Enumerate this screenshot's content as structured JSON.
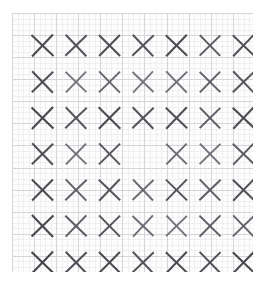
{
  "figure": {
    "background_color": "#ffffff",
    "paper_color": "#fdfdfd"
  },
  "grid_paper": {
    "name": "graph-paper",
    "left": 12,
    "top": 13,
    "width": 241,
    "height": 259,
    "minor_spacing": 5.52,
    "major_every": 4,
    "minor_color": "#e8e8ea",
    "major_color": "#d2d2d6",
    "minor_width": 0.6,
    "major_width": 0.9
  },
  "chart_data": {
    "type": "scatter",
    "xlabel": "",
    "ylabel": "",
    "rows": 7,
    "cols": 7,
    "marker": "x",
    "xlim": [
      0,
      7
    ],
    "ylim": [
      0,
      7
    ],
    "grid": true,
    "legend": false,
    "missing_cells": [
      [
        4,
        4
      ]
    ],
    "cell_width": 33.1,
    "cell_height": 35.4,
    "origin_x": 14,
    "origin_y": 15,
    "marker_size": 21,
    "stroke_width": 2.0,
    "markers": [
      {
        "row": 1,
        "col": 1,
        "cx": 30.5,
        "cy": 32.5,
        "size": 21.5,
        "color": "#4a4a4f",
        "width": 2.05,
        "rot": -1.5
      },
      {
        "row": 1,
        "col": 2,
        "cx": 64.0,
        "cy": 32.5,
        "size": 21.0,
        "color": "#53535a",
        "width": 2.0,
        "rot": 1.0
      },
      {
        "row": 1,
        "col": 3,
        "cx": 97.5,
        "cy": 32.5,
        "size": 21.0,
        "color": "#4d4d53",
        "width": 2.05,
        "rot": -0.5
      },
      {
        "row": 1,
        "col": 4,
        "cx": 131.0,
        "cy": 32.5,
        "size": 21.0,
        "color": "#54545b",
        "width": 2.0,
        "rot": 1.5
      },
      {
        "row": 1,
        "col": 5,
        "cx": 164.5,
        "cy": 32.5,
        "size": 21.0,
        "color": "#4b4b51",
        "width": 2.05,
        "rot": -1.0
      },
      {
        "row": 1,
        "col": 6,
        "cx": 198.0,
        "cy": 32.5,
        "size": 20.5,
        "color": "#5a5a61",
        "width": 1.95,
        "rot": 0.5
      },
      {
        "row": 1,
        "col": 7,
        "cx": 231.5,
        "cy": 32.5,
        "size": 21.0,
        "color": "#505057",
        "width": 2.0,
        "rot": -1.0
      },
      {
        "row": 2,
        "col": 1,
        "cx": 30.5,
        "cy": 69.0,
        "size": 21.0,
        "color": "#4e4e55",
        "width": 2.0,
        "rot": 1.0
      },
      {
        "row": 2,
        "col": 2,
        "cx": 64.0,
        "cy": 69.0,
        "size": 20.5,
        "color": "#73737b",
        "width": 1.85,
        "rot": -1.0
      },
      {
        "row": 2,
        "col": 3,
        "cx": 97.5,
        "cy": 69.0,
        "size": 21.0,
        "color": "#65656d",
        "width": 1.9,
        "rot": 0.5
      },
      {
        "row": 2,
        "col": 4,
        "cx": 131.0,
        "cy": 69.0,
        "size": 20.5,
        "color": "#75757d",
        "width": 1.85,
        "rot": -1.5
      },
      {
        "row": 2,
        "col": 5,
        "cx": 164.5,
        "cy": 69.0,
        "size": 21.0,
        "color": "#6d6d75",
        "width": 1.9,
        "rot": 1.0
      },
      {
        "row": 2,
        "col": 6,
        "cx": 198.0,
        "cy": 69.0,
        "size": 20.5,
        "color": "#5e5e66",
        "width": 1.95,
        "rot": -0.5
      },
      {
        "row": 2,
        "col": 7,
        "cx": 231.5,
        "cy": 69.0,
        "size": 21.0,
        "color": "#55555c",
        "width": 2.0,
        "rot": 1.0
      },
      {
        "row": 3,
        "col": 1,
        "cx": 30.5,
        "cy": 105.0,
        "size": 21.5,
        "color": "#48484e",
        "width": 2.1,
        "rot": -1.0
      },
      {
        "row": 3,
        "col": 2,
        "cx": 64.0,
        "cy": 105.0,
        "size": 21.0,
        "color": "#57575e",
        "width": 2.0,
        "rot": 1.5
      },
      {
        "row": 3,
        "col": 3,
        "cx": 97.5,
        "cy": 105.0,
        "size": 21.5,
        "color": "#4a4a50",
        "width": 2.1,
        "rot": -0.5
      },
      {
        "row": 3,
        "col": 4,
        "cx": 131.0,
        "cy": 105.0,
        "size": 21.0,
        "color": "#52525a",
        "width": 2.0,
        "rot": 1.0
      },
      {
        "row": 3,
        "col": 5,
        "cx": 164.5,
        "cy": 105.0,
        "size": 21.0,
        "color": "#4e4e55",
        "width": 2.05,
        "rot": -1.0
      },
      {
        "row": 3,
        "col": 6,
        "cx": 198.0,
        "cy": 105.0,
        "size": 20.5,
        "color": "#5c5c64",
        "width": 1.95,
        "rot": 0.5
      },
      {
        "row": 3,
        "col": 7,
        "cx": 231.5,
        "cy": 105.0,
        "size": 21.0,
        "color": "#4c4c52",
        "width": 2.05,
        "rot": -1.5
      },
      {
        "row": 4,
        "col": 1,
        "cx": 30.5,
        "cy": 141.0,
        "size": 21.0,
        "color": "#4f4f56",
        "width": 2.0,
        "rot": 1.0
      },
      {
        "row": 4,
        "col": 2,
        "cx": 64.0,
        "cy": 141.0,
        "size": 20.5,
        "color": "#70707a",
        "width": 1.85,
        "rot": -1.0
      },
      {
        "row": 4,
        "col": 3,
        "cx": 97.5,
        "cy": 141.0,
        "size": 21.0,
        "color": "#56565e",
        "width": 2.0,
        "rot": 0.5
      },
      {
        "row": 4,
        "col": 5,
        "cx": 164.5,
        "cy": 141.0,
        "size": 20.5,
        "color": "#6a6a73",
        "width": 1.9,
        "rot": -0.5
      },
      {
        "row": 4,
        "col": 6,
        "cx": 198.0,
        "cy": 141.0,
        "size": 20.5,
        "color": "#6e6e77",
        "width": 1.85,
        "rot": 1.0
      },
      {
        "row": 4,
        "col": 7,
        "cx": 231.5,
        "cy": 141.0,
        "size": 21.0,
        "color": "#5a5a62",
        "width": 1.95,
        "rot": -1.0
      },
      {
        "row": 5,
        "col": 1,
        "cx": 30.5,
        "cy": 177.0,
        "size": 21.0,
        "color": "#4b4b52",
        "width": 2.05,
        "rot": -0.5
      },
      {
        "row": 5,
        "col": 2,
        "cx": 64.0,
        "cy": 177.0,
        "size": 21.0,
        "color": "#60606a",
        "width": 1.95,
        "rot": 1.0
      },
      {
        "row": 5,
        "col": 3,
        "cx": 97.5,
        "cy": 177.0,
        "size": 21.0,
        "color": "#55555d",
        "width": 2.0,
        "rot": -1.0
      },
      {
        "row": 5,
        "col": 4,
        "cx": 131.0,
        "cy": 177.0,
        "size": 20.5,
        "color": "#6b6b74",
        "width": 1.9,
        "rot": 1.5
      },
      {
        "row": 5,
        "col": 5,
        "cx": 164.5,
        "cy": 177.0,
        "size": 21.0,
        "color": "#52525a",
        "width": 2.0,
        "rot": -0.5
      },
      {
        "row": 5,
        "col": 6,
        "cx": 198.0,
        "cy": 177.0,
        "size": 21.0,
        "color": "#5d5d66",
        "width": 1.95,
        "rot": 1.0
      },
      {
        "row": 5,
        "col": 7,
        "cx": 231.5,
        "cy": 177.0,
        "size": 21.0,
        "color": "#4e4e56",
        "width": 2.0,
        "rot": -1.0
      },
      {
        "row": 6,
        "col": 1,
        "cx": 30.5,
        "cy": 213.0,
        "size": 21.5,
        "color": "#47474d",
        "width": 2.1,
        "rot": 1.0
      },
      {
        "row": 6,
        "col": 2,
        "cx": 64.0,
        "cy": 213.0,
        "size": 21.0,
        "color": "#5b5b63",
        "width": 1.95,
        "rot": -1.0
      },
      {
        "row": 6,
        "col": 3,
        "cx": 97.5,
        "cy": 213.0,
        "size": 21.0,
        "color": "#54545c",
        "width": 2.0,
        "rot": 0.5
      },
      {
        "row": 6,
        "col": 4,
        "cx": 131.0,
        "cy": 213.0,
        "size": 20.5,
        "color": "#6c6c76",
        "width": 1.85,
        "rot": -1.5
      },
      {
        "row": 6,
        "col": 5,
        "cx": 164.5,
        "cy": 213.0,
        "size": 20.5,
        "color": "#6f6f79",
        "width": 1.85,
        "rot": 1.0
      },
      {
        "row": 6,
        "col": 6,
        "cx": 198.0,
        "cy": 213.0,
        "size": 21.0,
        "color": "#5a5a63",
        "width": 1.95,
        "rot": -0.5
      },
      {
        "row": 6,
        "col": 7,
        "cx": 231.5,
        "cy": 213.0,
        "size": 21.0,
        "color": "#63636c",
        "width": 1.9,
        "rot": 1.0
      },
      {
        "row": 7,
        "col": 1,
        "cx": 30.5,
        "cy": 249.5,
        "size": 21.5,
        "color": "#46464c",
        "width": 2.1,
        "rot": -1.0
      },
      {
        "row": 7,
        "col": 2,
        "cx": 64.0,
        "cy": 249.5,
        "size": 21.0,
        "color": "#4f4f57",
        "width": 2.05,
        "rot": 1.0
      },
      {
        "row": 7,
        "col": 3,
        "cx": 97.5,
        "cy": 249.5,
        "size": 21.0,
        "color": "#4a4a51",
        "width": 2.05,
        "rot": -0.5
      },
      {
        "row": 7,
        "col": 4,
        "cx": 131.0,
        "cy": 249.5,
        "size": 21.0,
        "color": "#535359",
        "width": 2.0,
        "rot": 1.5
      },
      {
        "row": 7,
        "col": 5,
        "cx": 164.5,
        "cy": 249.5,
        "size": 21.0,
        "color": "#4c4c53",
        "width": 2.05,
        "rot": -1.0
      },
      {
        "row": 7,
        "col": 6,
        "cx": 198.0,
        "cy": 249.5,
        "size": 21.0,
        "color": "#505058",
        "width": 2.0,
        "rot": 0.5
      },
      {
        "row": 7,
        "col": 7,
        "cx": 231.5,
        "cy": 249.5,
        "size": 21.0,
        "color": "#48484f",
        "width": 2.05,
        "rot": -1.0
      }
    ]
  }
}
